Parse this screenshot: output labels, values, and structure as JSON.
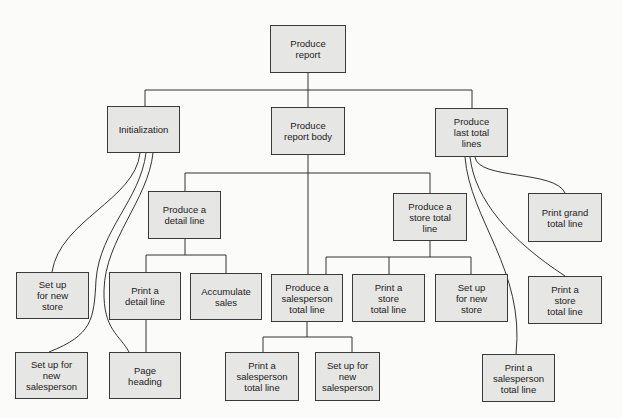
{
  "diagram": {
    "colors": {
      "box_fill": "#e6e6e4",
      "box_border": "#3a3a3a",
      "line": "#333333",
      "background": "#fbfbfa"
    },
    "nodes": {
      "root": {
        "label": "Produce\nreport"
      },
      "initialization": {
        "label": "Initialization"
      },
      "report_body": {
        "label": "Produce\nreport body"
      },
      "last_total_lines": {
        "label": "Produce\nlast total\nlines"
      },
      "detail_line": {
        "label": "Produce a\ndetail line"
      },
      "store_total_line": {
        "label": "Produce a\nstore total\nline"
      },
      "print_grand_total": {
        "label": "Print grand\ntotal line"
      },
      "setup_new_store_left": {
        "label": "Set up\nfor new\nstore"
      },
      "print_detail_line": {
        "label": "Print a\ndetail line"
      },
      "accumulate_sales": {
        "label": "Accumulate\nsales"
      },
      "salesperson_total_line": {
        "label": "Produce a\nsalesperson\ntotal line"
      },
      "print_store_total_mid": {
        "label": "Print a\nstore\ntotal line"
      },
      "setup_new_store_mid": {
        "label": "Set up\nfor new\nstore"
      },
      "print_store_total_right": {
        "label": "Print a\nstore\ntotal line"
      },
      "setup_new_salesperson_left": {
        "label": "Set up for\nnew\nsalesperson"
      },
      "page_heading": {
        "label": "Page\nheading"
      },
      "print_salesperson_total_mid": {
        "label": "Print a\nsalesperson\ntotal line"
      },
      "setup_new_salesperson_mid": {
        "label": "Set up for\nnew\nsalesperson"
      },
      "print_salesperson_total_right": {
        "label": "Print a\nsalesperson\ntotal line"
      }
    }
  }
}
